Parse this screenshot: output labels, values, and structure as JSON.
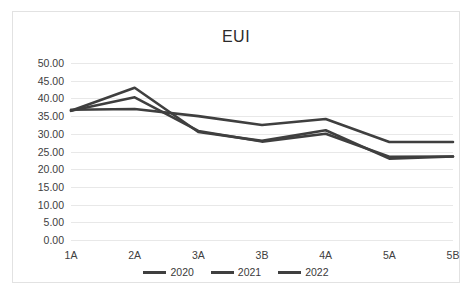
{
  "chart_data": {
    "type": "line",
    "title": "EUI",
    "xlabel": "",
    "ylabel": "",
    "categories": [
      "1A",
      "2A",
      "3A",
      "3B",
      "4A",
      "5A",
      "5B"
    ],
    "ylim": [
      0,
      50
    ],
    "ytick_step": 5,
    "ytick_labels": [
      "0.00",
      "5.00",
      "10.00",
      "15.00",
      "20.00",
      "25.00",
      "30.00",
      "35.00",
      "40.00",
      "45.00",
      "50.00"
    ],
    "ytick_values": [
      0,
      5,
      10,
      15,
      20,
      25,
      30,
      35,
      40,
      45,
      50
    ],
    "grid": true,
    "legend_position": "bottom",
    "series": [
      {
        "name": "2020",
        "color": "#3f3f3f",
        "values": [
          36.5,
          43.0,
          30.5,
          28.0,
          31.0,
          23.0,
          23.6
        ]
      },
      {
        "name": "2021",
        "color": "#3f3f3f",
        "values": [
          36.5,
          40.3,
          30.8,
          27.8,
          30.0,
          23.5,
          23.6
        ]
      },
      {
        "name": "2022",
        "color": "#3f3f3f",
        "values": [
          36.8,
          37.0,
          35.0,
          32.5,
          34.2,
          27.7,
          27.7
        ]
      }
    ]
  },
  "colors": {
    "frame_border": "#e2e2e2",
    "gridline": "#e8e8e8",
    "text": "#404040",
    "line": "#3f3f3f",
    "background": "#ffffff"
  }
}
